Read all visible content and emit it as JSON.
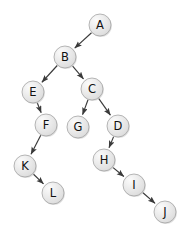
{
  "diagram": {
    "type": "tree-graph",
    "title": "",
    "canvas": {
      "width": 187,
      "height": 238,
      "background": "#ffffff"
    },
    "node_style": {
      "radius": 11,
      "fill": "#e6e6e6",
      "highlight": "#fbfbfb",
      "border": "#9a9a9a",
      "label_color": "#111111"
    },
    "edge_style": {
      "color": "#3a3a3a",
      "width": 1.15,
      "arrowhead": "filled-triangle"
    },
    "nodes": [
      {
        "id": "A",
        "label": "A",
        "x": 100,
        "y": 25
      },
      {
        "id": "B",
        "label": "B",
        "x": 65,
        "y": 57
      },
      {
        "id": "E",
        "label": "E",
        "x": 33,
        "y": 92
      },
      {
        "id": "C",
        "label": "C",
        "x": 92,
        "y": 89
      },
      {
        "id": "F",
        "label": "F",
        "x": 46,
        "y": 125
      },
      {
        "id": "G",
        "label": "G",
        "x": 78,
        "y": 127
      },
      {
        "id": "D",
        "label": "D",
        "x": 118,
        "y": 126
      },
      {
        "id": "K",
        "label": "K",
        "x": 25,
        "y": 166
      },
      {
        "id": "H",
        "label": "H",
        "x": 104,
        "y": 160
      },
      {
        "id": "L",
        "label": "L",
        "x": 53,
        "y": 193
      },
      {
        "id": "I",
        "label": "I",
        "x": 134,
        "y": 185
      },
      {
        "id": "J",
        "label": "J",
        "x": 165,
        "y": 212
      }
    ],
    "edges": [
      {
        "from": "A",
        "to": "B",
        "directed": true
      },
      {
        "from": "B",
        "to": "E",
        "directed": true
      },
      {
        "from": "B",
        "to": "C",
        "directed": true
      },
      {
        "from": "E",
        "to": "F",
        "directed": true
      },
      {
        "from": "C",
        "to": "G",
        "directed": true
      },
      {
        "from": "C",
        "to": "D",
        "directed": true
      },
      {
        "from": "F",
        "to": "K",
        "directed": true
      },
      {
        "from": "D",
        "to": "H",
        "directed": true
      },
      {
        "from": "K",
        "to": "L",
        "directed": true
      },
      {
        "from": "H",
        "to": "I",
        "directed": true
      },
      {
        "from": "I",
        "to": "J",
        "directed": true
      }
    ]
  }
}
